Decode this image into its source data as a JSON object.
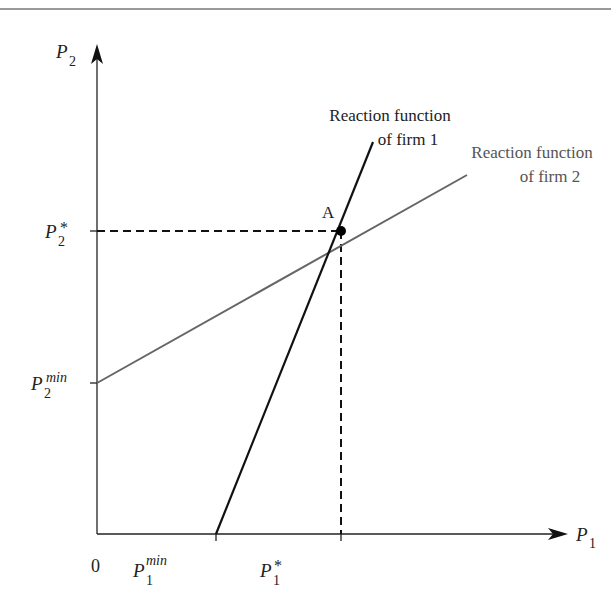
{
  "diagram": {
    "axes": {
      "x_label": "P",
      "x_label_sub": "1",
      "y_label": "P",
      "y_label_sub": "2",
      "origin": "0"
    },
    "ticks": {
      "p1_min": {
        "base": "P",
        "sub": "1",
        "sup": "min"
      },
      "p1_star": {
        "base": "P",
        "sub": "1",
        "sup": "*"
      },
      "p2_min": {
        "base": "P",
        "sub": "2",
        "sup": "min"
      },
      "p2_star": {
        "base": "P",
        "sub": "2",
        "sup": "*"
      }
    },
    "curves": {
      "firm1": {
        "label_line1": "Reaction function",
        "label_line2": "of firm 1",
        "color": "#111111"
      },
      "firm2": {
        "label_line1": "Reaction function",
        "label_line2": "of firm 2",
        "color": "#666666"
      }
    },
    "equilibrium": {
      "label": "A"
    }
  }
}
